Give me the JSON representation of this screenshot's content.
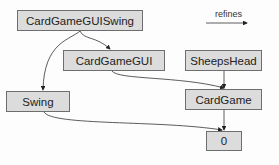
{
  "diagram": {
    "type": "feature-refinement-graph",
    "nodes": [
      {
        "id": "CardGameGUISwing",
        "label": "CardGameGUISwing"
      },
      {
        "id": "CardGameGUI",
        "label": "CardGameGUI"
      },
      {
        "id": "SheepsHead",
        "label": "SheepsHead"
      },
      {
        "id": "Swing",
        "label": "Swing"
      },
      {
        "id": "CardGame",
        "label": "CardGame"
      },
      {
        "id": "Zero",
        "label": "0"
      }
    ],
    "edges": [
      {
        "from": "CardGameGUISwing",
        "to": "CardGameGUI"
      },
      {
        "from": "CardGameGUISwing",
        "to": "Swing"
      },
      {
        "from": "CardGameGUI",
        "to": "CardGame"
      },
      {
        "from": "SheepsHead",
        "to": "CardGame"
      },
      {
        "from": "Swing",
        "to": "Zero"
      },
      {
        "from": "CardGame",
        "to": "Zero"
      }
    ],
    "legend": {
      "label": "refines"
    }
  },
  "colors": {
    "node_fill": "#dcdcdc",
    "node_border": "#6e6e6e",
    "edge": "#333333"
  }
}
